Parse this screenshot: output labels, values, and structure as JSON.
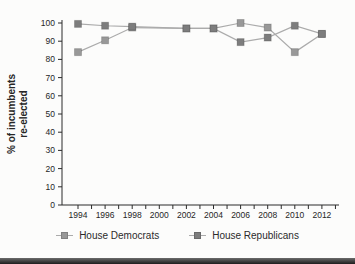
{
  "figure": {
    "background_color": "#fcfcfb",
    "axis_color": "#2b2b2b",
    "tick_label_color": "#262626",
    "bottom_bar": "page-edge-dark-band"
  },
  "chart_data": {
    "type": "line",
    "title": "",
    "xlabel": "",
    "ylabel_line1": "% of incumbents",
    "ylabel_line2": "re-elected",
    "x": [
      1994,
      1996,
      1998,
      2000,
      2002,
      2004,
      2006,
      2008,
      2010,
      2012
    ],
    "x_tick_labels": [
      "1994",
      "1996",
      "1998",
      "2000",
      "2002",
      "2004",
      "2006",
      "2008",
      "2010",
      "2012"
    ],
    "ylim": [
      0,
      100
    ],
    "ytick_step": 10,
    "ytick_labels": [
      "0",
      "10",
      "20",
      "30",
      "40",
      "50",
      "60",
      "70",
      "80",
      "90",
      "100"
    ],
    "grid": false,
    "legend_position": "bottom",
    "line_color": "#ababab",
    "marker": "square",
    "series": [
      {
        "name": "House Democrats",
        "color": "#989898",
        "values": [
          84,
          90.5,
          97.5,
          null,
          97,
          97,
          100,
          97.5,
          84,
          94
        ]
      },
      {
        "name": "House Republicans",
        "color": "#7d7d7d",
        "values": [
          99.5,
          98.5,
          98,
          null,
          97,
          97,
          89.5,
          92,
          98.5,
          94
        ]
      }
    ]
  }
}
